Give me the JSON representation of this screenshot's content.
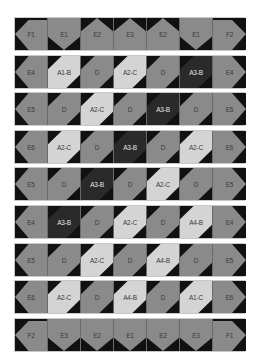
{
  "colors": {
    "background": "#111111",
    "medium": "#8a8a8a",
    "light": "#d4d4d4",
    "dark": "#2a2a2a",
    "label_dark_text": "#e8e8e8",
    "label_light_text": "#3b3b3b"
  },
  "rows": [
    {
      "cells": [
        {
          "label": "F1",
          "shape": "pent-left",
          "tone": "medium"
        },
        {
          "label": "E1",
          "shape": "pent-down",
          "tone": "medium"
        },
        {
          "label": "E2",
          "shape": "pent-up",
          "tone": "medium"
        },
        {
          "label": "E3",
          "shape": "pent-up",
          "tone": "medium"
        },
        {
          "label": "E2",
          "shape": "pent-up",
          "tone": "medium"
        },
        {
          "label": "E1",
          "shape": "pent-down",
          "tone": "medium"
        },
        {
          "label": "F2",
          "shape": "pent-right",
          "tone": "medium"
        }
      ]
    },
    {
      "cells": [
        {
          "label": "E4",
          "shape": "diamond-left",
          "tone": "medium"
        },
        {
          "label": "A1-B",
          "shape": "band",
          "tone": "light"
        },
        {
          "label": "D",
          "shape": "band",
          "tone": "medium"
        },
        {
          "label": "A2-C",
          "shape": "band",
          "tone": "light"
        },
        {
          "label": "D",
          "shape": "band",
          "tone": "medium"
        },
        {
          "label": "A3-B",
          "shape": "band",
          "tone": "dark"
        },
        {
          "label": "E4",
          "shape": "diamond-right",
          "tone": "medium"
        }
      ]
    },
    {
      "cells": [
        {
          "label": "E5",
          "shape": "diamond-left",
          "tone": "medium"
        },
        {
          "label": "D",
          "shape": "band",
          "tone": "medium"
        },
        {
          "label": "A2-C",
          "shape": "band",
          "tone": "light"
        },
        {
          "label": "D",
          "shape": "band",
          "tone": "medium"
        },
        {
          "label": "A3-B",
          "shape": "band",
          "tone": "dark"
        },
        {
          "label": "D",
          "shape": "band",
          "tone": "medium"
        },
        {
          "label": "E5",
          "shape": "diamond-right",
          "tone": "medium"
        }
      ]
    },
    {
      "cells": [
        {
          "label": "E6",
          "shape": "diamond-left",
          "tone": "medium"
        },
        {
          "label": "A2-C",
          "shape": "band",
          "tone": "light"
        },
        {
          "label": "D",
          "shape": "band",
          "tone": "medium"
        },
        {
          "label": "A3-B",
          "shape": "band",
          "tone": "dark"
        },
        {
          "label": "D",
          "shape": "band",
          "tone": "medium"
        },
        {
          "label": "A2-C",
          "shape": "band",
          "tone": "light"
        },
        {
          "label": "E6",
          "shape": "diamond-right",
          "tone": "medium"
        }
      ]
    },
    {
      "cells": [
        {
          "label": "E5",
          "shape": "diamond-left",
          "tone": "medium"
        },
        {
          "label": "D",
          "shape": "band",
          "tone": "medium"
        },
        {
          "label": "A3-B",
          "shape": "band",
          "tone": "dark"
        },
        {
          "label": "D",
          "shape": "band",
          "tone": "medium"
        },
        {
          "label": "A2-C",
          "shape": "band",
          "tone": "light"
        },
        {
          "label": "D",
          "shape": "band",
          "tone": "medium"
        },
        {
          "label": "E5",
          "shape": "diamond-right",
          "tone": "medium"
        }
      ]
    },
    {
      "cells": [
        {
          "label": "E4",
          "shape": "diamond-left",
          "tone": "medium"
        },
        {
          "label": "A3-B",
          "shape": "band",
          "tone": "dark"
        },
        {
          "label": "D",
          "shape": "band",
          "tone": "medium"
        },
        {
          "label": "A2-C",
          "shape": "band",
          "tone": "light"
        },
        {
          "label": "D",
          "shape": "band",
          "tone": "medium"
        },
        {
          "label": "A4-B",
          "shape": "band",
          "tone": "light"
        },
        {
          "label": "E4",
          "shape": "diamond-right",
          "tone": "medium"
        }
      ]
    },
    {
      "cells": [
        {
          "label": "E5",
          "shape": "diamond-left",
          "tone": "medium"
        },
        {
          "label": "D",
          "shape": "band",
          "tone": "medium"
        },
        {
          "label": "A2-C",
          "shape": "band",
          "tone": "light"
        },
        {
          "label": "D",
          "shape": "band",
          "tone": "medium"
        },
        {
          "label": "A4-B",
          "shape": "band",
          "tone": "light"
        },
        {
          "label": "D",
          "shape": "band",
          "tone": "medium"
        },
        {
          "label": "E5",
          "shape": "diamond-right",
          "tone": "medium"
        }
      ]
    },
    {
      "cells": [
        {
          "label": "E6",
          "shape": "diamond-left",
          "tone": "medium"
        },
        {
          "label": "A2-C",
          "shape": "band",
          "tone": "light"
        },
        {
          "label": "D",
          "shape": "band",
          "tone": "medium"
        },
        {
          "label": "A4-B",
          "shape": "band",
          "tone": "light"
        },
        {
          "label": "D",
          "shape": "band",
          "tone": "medium"
        },
        {
          "label": "A1-C",
          "shape": "band",
          "tone": "light"
        },
        {
          "label": "E6",
          "shape": "diamond-right",
          "tone": "medium"
        }
      ]
    },
    {
      "cells": [
        {
          "label": "F2",
          "shape": "pent-left",
          "tone": "medium"
        },
        {
          "label": "E3",
          "shape": "pent-down",
          "tone": "medium"
        },
        {
          "label": "E2",
          "shape": "pent-down",
          "tone": "medium"
        },
        {
          "label": "E1",
          "shape": "pent-down",
          "tone": "medium"
        },
        {
          "label": "E2",
          "shape": "pent-down",
          "tone": "medium"
        },
        {
          "label": "E3",
          "shape": "pent-down",
          "tone": "medium"
        },
        {
          "label": "F1",
          "shape": "pent-right",
          "tone": "medium"
        }
      ]
    }
  ]
}
